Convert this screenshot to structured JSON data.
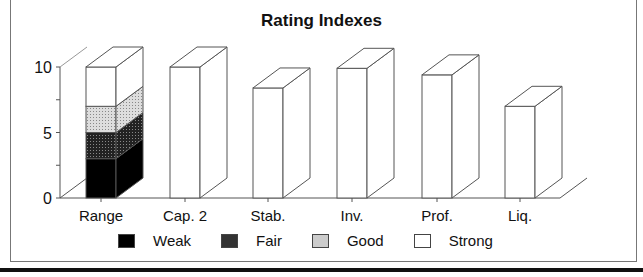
{
  "chart_data": {
    "type": "bar",
    "subtype": "3d-stacked-bar",
    "title": "Rating Indexes",
    "xlabel": "",
    "ylabel": "",
    "ylim": [
      0,
      10
    ],
    "yticks": [
      "0",
      "5",
      "10"
    ],
    "categories": [
      "Range",
      "Cap. 2",
      "Stab.",
      "Inv.",
      "Prof.",
      "Liq."
    ],
    "range_bar": {
      "category": "Range",
      "segments": [
        {
          "name": "Weak",
          "from": 0,
          "to": 3
        },
        {
          "name": "Fair",
          "from": 3,
          "to": 5
        },
        {
          "name": "Good",
          "from": 5,
          "to": 7
        },
        {
          "name": "Strong",
          "from": 7,
          "to": 10
        }
      ]
    },
    "values": [
      10,
      10,
      8.4,
      9.9,
      9.4,
      7.0
    ],
    "series": [
      {
        "name": "Weak",
        "values": [
          3,
          0,
          0,
          0,
          0,
          0
        ]
      },
      {
        "name": "Fair",
        "values": [
          2,
          0,
          0,
          0,
          0,
          0
        ]
      },
      {
        "name": "Good",
        "values": [
          2,
          0,
          0,
          0,
          0,
          0
        ]
      },
      {
        "name": "Strong",
        "values": [
          3,
          10,
          8.4,
          9.9,
          9.4,
          7.0
        ]
      }
    ],
    "legend": [
      "Weak",
      "Fair",
      "Good",
      "Strong"
    ],
    "legend_position": "bottom",
    "grid": false
  },
  "legend": {
    "items": [
      {
        "label": "Weak",
        "color": "#000000"
      },
      {
        "label": "Fair",
        "color": "#333333"
      },
      {
        "label": "Good",
        "color": "#cccccc"
      },
      {
        "label": "Strong",
        "color": "#ffffff"
      }
    ]
  }
}
